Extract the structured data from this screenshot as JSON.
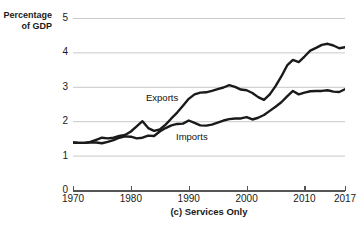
{
  "chart_data": {
    "type": "line",
    "title": "",
    "caption": "(c) Services Only",
    "ylabel": "Percentage\nof GDP",
    "ylabel_line1": "Percentage",
    "ylabel_line2": "of GDP",
    "xlabel": "",
    "xlim": [
      1970,
      2017
    ],
    "ylim": [
      0,
      5
    ],
    "yticks": [
      0,
      1,
      2,
      3,
      4,
      5
    ],
    "ytick_labels": [
      "0",
      "1",
      "2",
      "3",
      "4",
      "5"
    ],
    "xticks": [
      1970,
      1980,
      1990,
      2000,
      2010,
      2017
    ],
    "xtick_labels": [
      "1970",
      "1980",
      "1990",
      "2000",
      "2010",
      "2017"
    ],
    "grid": "horizontal",
    "legend": "inline-annotations",
    "line_color": "#1a1a1a",
    "grid_color": "#c9c9c9",
    "x": [
      1970,
      1971,
      1972,
      1973,
      1974,
      1975,
      1976,
      1977,
      1978,
      1979,
      1980,
      1981,
      1982,
      1983,
      1984,
      1985,
      1986,
      1987,
      1988,
      1989,
      1990,
      1991,
      1992,
      1993,
      1994,
      1995,
      1996,
      1997,
      1998,
      1999,
      2000,
      2001,
      2002,
      2003,
      2004,
      2005,
      2006,
      2007,
      2008,
      2009,
      2010,
      2011,
      2012,
      2013,
      2014,
      2015,
      2016,
      2017
    ],
    "series": [
      {
        "name": "Exports",
        "values": [
          1.38,
          1.37,
          1.37,
          1.4,
          1.46,
          1.52,
          1.5,
          1.52,
          1.57,
          1.6,
          1.7,
          1.85,
          2.0,
          1.8,
          1.72,
          1.76,
          1.9,
          2.08,
          2.25,
          2.45,
          2.65,
          2.78,
          2.83,
          2.84,
          2.88,
          2.93,
          2.98,
          3.05,
          3.0,
          2.92,
          2.9,
          2.82,
          2.7,
          2.62,
          2.78,
          3.02,
          3.3,
          3.62,
          3.78,
          3.72,
          3.88,
          4.05,
          4.13,
          4.22,
          4.25,
          4.2,
          4.12,
          4.15
        ]
      },
      {
        "name": "Imports",
        "values": [
          1.38,
          1.37,
          1.37,
          1.38,
          1.38,
          1.36,
          1.4,
          1.45,
          1.52,
          1.56,
          1.55,
          1.5,
          1.52,
          1.58,
          1.57,
          1.7,
          1.8,
          1.88,
          1.92,
          1.93,
          2.02,
          1.95,
          1.88,
          1.87,
          1.9,
          1.96,
          2.02,
          2.06,
          2.08,
          2.08,
          2.12,
          2.05,
          2.1,
          2.18,
          2.3,
          2.42,
          2.55,
          2.72,
          2.88,
          2.78,
          2.83,
          2.87,
          2.88,
          2.88,
          2.9,
          2.86,
          2.85,
          2.93
        ]
      }
    ],
    "annotations": [
      {
        "text": "Exports",
        "x": 1989,
        "y": 3.0
      },
      {
        "text": "Imports",
        "x": 1994,
        "y": 1.75
      }
    ]
  }
}
